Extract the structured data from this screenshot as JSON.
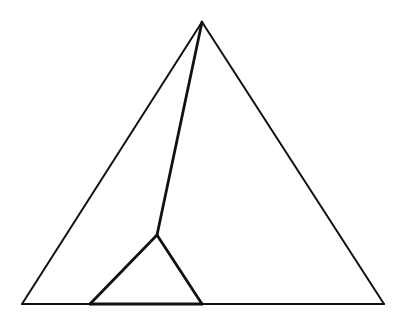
{
  "diagram": {
    "stroke_color": "#111111",
    "background_color": "#ffffff",
    "vertices": {
      "apex": "A",
      "base_left": "B",
      "base_right": "C",
      "interior": "D",
      "inner_base_left": "E",
      "inner_base_right": "F"
    },
    "edges": [
      {
        "id": "outer-left-side",
        "from": "apex",
        "to": "base_left"
      },
      {
        "id": "outer-right-side",
        "from": "apex",
        "to": "base_right"
      },
      {
        "id": "outer-base",
        "from": "base_left",
        "to": "base_right"
      },
      {
        "id": "apex-to-interior",
        "from": "apex",
        "to": "interior"
      },
      {
        "id": "inner-left-side",
        "from": "interior",
        "to": "inner_base_left"
      },
      {
        "id": "inner-right-side",
        "from": "interior",
        "to": "inner_base_right"
      },
      {
        "id": "inner-base",
        "from": "inner_base_left",
        "to": "inner_base_right"
      }
    ]
  }
}
